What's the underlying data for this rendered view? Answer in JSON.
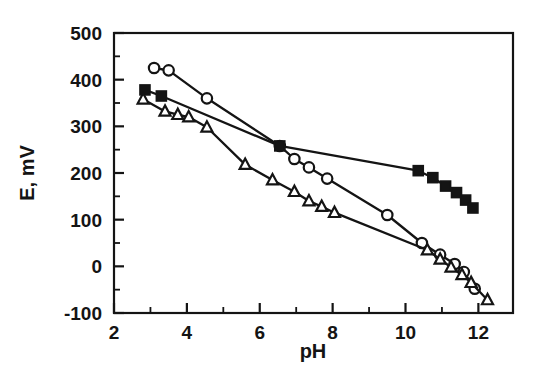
{
  "chart_data": {
    "type": "line",
    "title": "",
    "xlabel": "pH",
    "ylabel": "E, mV",
    "xlim": [
      2,
      12.95
    ],
    "ylim": [
      -100,
      500
    ],
    "grid": false,
    "legend": "none",
    "xticks": [
      2,
      4,
      6,
      8,
      10,
      12
    ],
    "xtick_labels": [
      "2",
      "4",
      "6",
      "8",
      "10",
      "12"
    ],
    "xticks_minor": [
      3,
      5,
      7,
      9,
      11
    ],
    "yticks": [
      -100,
      0,
      100,
      200,
      300,
      400,
      500
    ],
    "ytick_labels": [
      "-100",
      "0",
      "100",
      "200",
      "300",
      "400",
      "500"
    ],
    "yticks_minor": [
      -50,
      50,
      150,
      250,
      350,
      450
    ],
    "series": [
      {
        "name": "open-circles",
        "marker": "circle-open",
        "color": "#141414",
        "x": [
          3.1,
          3.5,
          4.55,
          6.55,
          6.95,
          7.35,
          7.85,
          9.5,
          10.45,
          10.95,
          11.35,
          11.6,
          11.9
        ],
        "y": [
          425,
          420,
          360,
          258,
          230,
          212,
          188,
          110,
          50,
          25,
          5,
          -12,
          -48
        ]
      },
      {
        "name": "filled-squares",
        "marker": "square-filled",
        "color": "#141414",
        "x": [
          2.85,
          3.3,
          6.55,
          10.35,
          10.75,
          11.1,
          11.4,
          11.65,
          11.85
        ],
        "y": [
          378,
          365,
          258,
          205,
          190,
          172,
          158,
          142,
          125
        ]
      },
      {
        "name": "open-triangles",
        "marker": "triangle-open",
        "color": "#141414",
        "x": [
          2.8,
          3.4,
          3.75,
          4.05,
          4.55,
          5.6,
          6.35,
          6.95,
          7.35,
          7.7,
          8.05,
          10.6,
          10.95,
          11.25,
          11.55,
          11.8,
          12.25
        ],
        "y": [
          358,
          332,
          325,
          320,
          298,
          218,
          185,
          160,
          140,
          128,
          115,
          35,
          15,
          -2,
          -18,
          -35,
          -72
        ]
      }
    ]
  },
  "axis": {
    "xlabel": "pH",
    "ylabel": "E, mV"
  }
}
